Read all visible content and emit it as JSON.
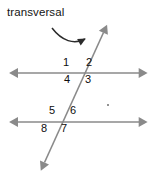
{
  "figure": {
    "width": 153,
    "height": 179,
    "background_color": "#ffffff",
    "caption_label": "transversal",
    "line_color": "#8a8a8a",
    "text_color": "#111111",
    "annotation_arrow_color": "#2b2b2b"
  },
  "angles": {
    "upper_intersection": {
      "position": [
        80,
        73
      ],
      "labels": {
        "top_left": "1",
        "top_right": "2",
        "bottom_left": "4",
        "bottom_right": "3"
      }
    },
    "lower_intersection": {
      "position": [
        58,
        122
      ],
      "labels": {
        "top_left": "5",
        "top_right": "6",
        "bottom_left": "8",
        "bottom_right": "7"
      }
    }
  },
  "lines": {
    "upper_parallel": {
      "x1": 14,
      "y1": 73,
      "x2": 143,
      "y2": 73
    },
    "lower_parallel": {
      "x1": 14,
      "y1": 122,
      "x2": 143,
      "y2": 122
    },
    "transversal": {
      "x1": 42,
      "y1": 168,
      "x2": 106,
      "y2": 27
    }
  }
}
